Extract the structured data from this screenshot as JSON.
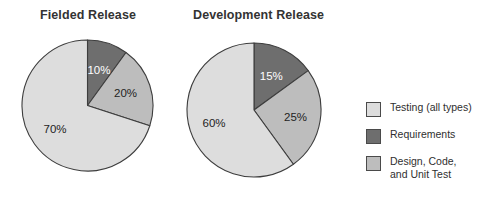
{
  "chart_data": {
    "type": "pie",
    "title": "",
    "charts": [
      {
        "title": "Fielded Release",
        "labels": [
          "Requirements",
          "Design, Code, and Unit Test",
          "Testing (all types)"
        ],
        "values": [
          10,
          20,
          70
        ],
        "value_labels": [
          "10%",
          "20%",
          "70%"
        ],
        "colors": [
          "#6e6e6e",
          "#bdbdbd",
          "#dddddd"
        ],
        "start_angle_deg": 0,
        "direction": "clockwise"
      },
      {
        "title": "Development Release",
        "labels": [
          "Requirements",
          "Design, Code, and Unit Test",
          "Testing (all types)"
        ],
        "values": [
          15,
          25,
          60
        ],
        "value_labels": [
          "15%",
          "25%",
          "60%"
        ],
        "colors": [
          "#6e6e6e",
          "#bdbdbd",
          "#dddddd"
        ],
        "start_angle_deg": 0,
        "direction": "clockwise"
      }
    ],
    "legend": {
      "position": "right",
      "entries": [
        {
          "label": "Testing (all types)",
          "color": "#dddddd"
        },
        {
          "label": "Requirements",
          "color": "#6e6e6e"
        },
        {
          "label": "Design, Code,\nand Unit Test",
          "color": "#bdbdbd"
        }
      ]
    },
    "grid": false,
    "xlabel": "",
    "ylabel": ""
  },
  "figure": {
    "title_1": "Fielded Release",
    "title_2": "Development Release",
    "pie_1": {
      "slice_1_value": "10%",
      "slice_2_value": "20%",
      "slice_3_value": "70%"
    },
    "pie_2": {
      "slice_1_value": "15%",
      "slice_2_value": "25%",
      "slice_3_value": "60%"
    }
  },
  "legend": {
    "item_1": "Testing (all types)",
    "item_2": "Requirements",
    "item_3": "Design, Code,\nand Unit Test"
  },
  "colors": {
    "testing": "#dddddd",
    "requirements": "#6e6e6e",
    "design_code": "#bdbdbd",
    "outline": "#3d3d3d",
    "text": "#2f2f2f"
  }
}
